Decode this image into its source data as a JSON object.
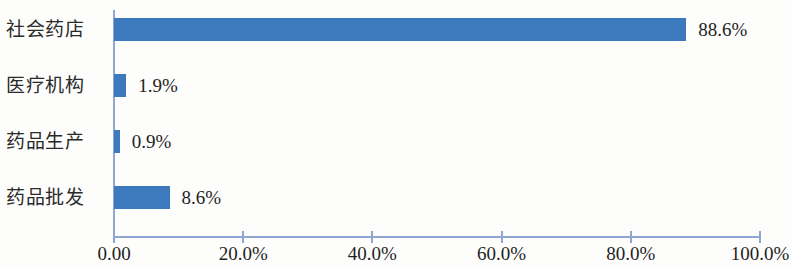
{
  "chart_data": {
    "type": "bar",
    "orientation": "horizontal",
    "title": "",
    "subtitle": "",
    "xlabel": "",
    "ylabel": "",
    "categories": [
      "社会药店",
      "医疗机构",
      "药品生产",
      "药品批发"
    ],
    "values": [
      88.6,
      1.9,
      0.9,
      8.6
    ],
    "value_labels": [
      "88.6%",
      "1.9%",
      "0.9%",
      "8.6%"
    ],
    "series": [
      {
        "name": "",
        "values": [
          88.6,
          1.9,
          0.9,
          8.6
        ]
      }
    ],
    "xlim": [
      0,
      100
    ],
    "ylim": null,
    "x_tick_values": [
      0,
      20,
      40,
      60,
      80,
      100
    ],
    "x_tick_labels": [
      "0.00",
      "20.0%",
      "40.0%",
      "60.0%",
      "80.0%",
      "100.0%"
    ],
    "grid": false,
    "legend": null,
    "legend_position": "none",
    "annotations": [],
    "colors": {
      "bar": "#3c79bd",
      "axis": "#8ea7d2",
      "text": "#1f1f1f",
      "background": "#fdfdfc"
    }
  }
}
